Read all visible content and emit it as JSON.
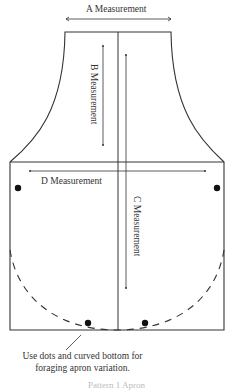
{
  "diagram": {
    "type": "apron-pattern",
    "labels": {
      "a": "A Measurement",
      "b": "B Measurement",
      "c": "C Measurement",
      "d": "D Measurement"
    },
    "caption": {
      "line1": "Use dots and curved bottom for",
      "line2": "foraging apron variation."
    },
    "footer_partial": "Pattern 1 Apron"
  }
}
